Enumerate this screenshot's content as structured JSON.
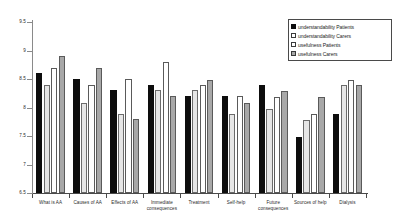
{
  "chart_data": {
    "type": "bar",
    "title": "",
    "xlabel": "",
    "ylabel": "",
    "ylim": [
      6.5,
      9.5
    ],
    "yticks": [
      "9.5",
      "9",
      "8.5",
      "8",
      "7.5",
      "7",
      "6.5"
    ],
    "grid": false,
    "legend_position": "top-right",
    "categories": [
      "What is AA",
      "Causes of AA",
      "Effects of AA",
      "Immediate consequences",
      "Treatment",
      "Self-help",
      "Future consequences",
      "Sources of help",
      "Dialysis"
    ],
    "series": [
      {
        "name": "understandability Patients",
        "color": "#0d0d0d",
        "values": [
          8.6,
          8.5,
          8.3,
          8.4,
          8.2,
          8.2,
          8.4,
          7.49,
          7.88
        ]
      },
      {
        "name": "understandability Carers",
        "color": "#e6e6e6",
        "values": [
          8.4,
          8.08,
          7.89,
          8.3,
          8.3,
          7.89,
          7.98,
          7.78,
          8.4
        ]
      },
      {
        "name": "usefulness Patients",
        "color": "#ffffff",
        "values": [
          8.7,
          8.4,
          8.5,
          8.79,
          8.4,
          8.2,
          8.19,
          7.88,
          8.49
        ]
      },
      {
        "name": "usefulness Carers",
        "color": "#a8a8a8",
        "values": [
          8.9,
          8.7,
          7.79,
          8.2,
          8.49,
          8.08,
          8.29,
          8.19,
          8.4
        ]
      }
    ]
  },
  "legend": {
    "items": [
      {
        "label": "understandability Patients"
      },
      {
        "label": "understandability Carers"
      },
      {
        "label": "usefulness Patients"
      },
      {
        "label": "usefulness Carers"
      }
    ]
  }
}
